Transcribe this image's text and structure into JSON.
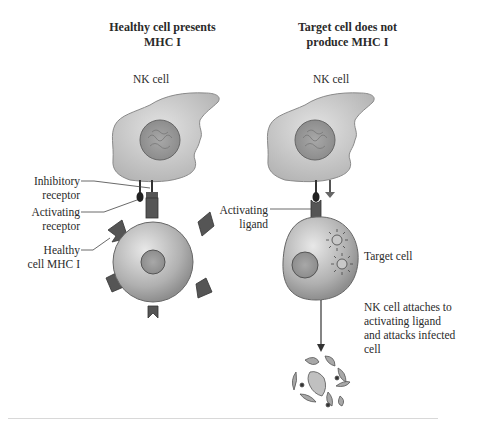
{
  "left_panel": {
    "title_line1": "Healthy cell presents",
    "title_line2": "MHC I",
    "nk_label": "NK cell",
    "labels": {
      "inhibitory_1": "Inhibitory",
      "inhibitory_2": "receptor",
      "activating_1": "Activating",
      "activating_2": "receptor",
      "healthy_1": "Healthy",
      "healthy_2": "cell MHC I"
    }
  },
  "right_panel": {
    "title_line1": "Target cell does not",
    "title_line2": "produce MHC I",
    "nk_label": "NK cell",
    "labels": {
      "ligand_1": "Activating",
      "ligand_2": "ligand",
      "target": "Target cell",
      "caption_1": "NK cell attaches to",
      "caption_2": "activating ligand",
      "caption_3": "and attacks infected",
      "caption_4": "cell"
    }
  },
  "colors": {
    "cell_fill": "#c8c8c8",
    "cell_dark": "#8a8a8a",
    "receptor": "#555555",
    "text": "#2a2a2a"
  }
}
